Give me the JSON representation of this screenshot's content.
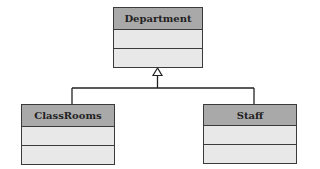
{
  "diagram": {
    "type": "uml-class-generalization",
    "classes": [
      {
        "id": "department",
        "name": "Department",
        "attributes": [],
        "operations": []
      },
      {
        "id": "classrooms",
        "name": "ClassRooms",
        "attributes": [],
        "operations": []
      },
      {
        "id": "staff",
        "name": "Staff",
        "attributes": [],
        "operations": []
      }
    ],
    "relationships": [
      {
        "type": "generalization",
        "from": "ClassRooms",
        "to": "Department"
      },
      {
        "type": "generalization",
        "from": "Staff",
        "to": "Department"
      }
    ],
    "colors": {
      "header": "#a9a9a9",
      "compartment": "#e8e8e8",
      "border": "#3a3a3a",
      "line": "#222222"
    }
  }
}
